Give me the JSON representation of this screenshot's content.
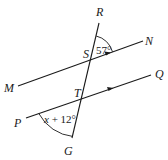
{
  "diagram": {
    "points": {
      "R": "R",
      "S": "S",
      "N": "N",
      "M": "M",
      "T": "T",
      "Q": "Q",
      "P": "P",
      "G": "G"
    },
    "angles": {
      "angle_RSN": {
        "label": "57°"
      },
      "angle_PTG": {
        "var": "x",
        "rest": " + 12°"
      }
    },
    "parallel_marks": [
      "single-arrow on MN",
      "single-arrow on PQ"
    ],
    "colors": {
      "stroke": "#1a1a1a",
      "background": "#ffffff"
    }
  }
}
